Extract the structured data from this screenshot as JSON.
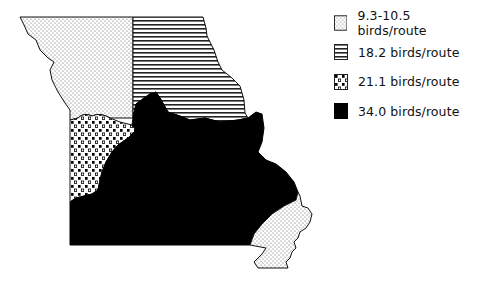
{
  "map": {
    "region": "Missouri",
    "regions": [
      {
        "name": "north-west",
        "pattern": "fine-dots",
        "value": "9.3-10.5 birds/route"
      },
      {
        "name": "north-east",
        "pattern": "horizontal-lines",
        "value": "18.2 birds/route"
      },
      {
        "name": "west-central",
        "pattern": "coarse-dots",
        "value": "21.1 birds/route"
      },
      {
        "name": "central-south",
        "pattern": "solid-black",
        "value": "34.0 birds/route"
      },
      {
        "name": "south-east-bootheel",
        "pattern": "fine-dots",
        "value": "9.3-10.5 birds/route"
      }
    ]
  },
  "legend": {
    "items": [
      {
        "pattern": "fine-dots",
        "label": "9.3-10.5 birds/route"
      },
      {
        "pattern": "horizontal-lines",
        "label": "18.2 birds/route"
      },
      {
        "pattern": "coarse-dots",
        "label": "21.1 birds/route"
      },
      {
        "pattern": "solid-black",
        "label": "34.0 birds/route"
      }
    ]
  },
  "colors": {
    "ink": "#000000",
    "background": "#ffffff"
  }
}
